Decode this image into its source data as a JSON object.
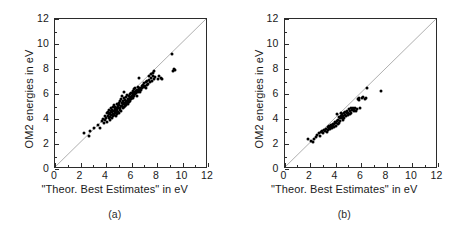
{
  "figure": {
    "panels": [
      {
        "id": "panel-a",
        "caption": "(a)",
        "xlabel": "\"Theor. Best Estimates\" in eV",
        "ylabel": "OM2 energies in eV"
      },
      {
        "id": "panel-b",
        "caption": "(b)",
        "xlabel": "\"Theor. Best Estimates\" in eV",
        "ylabel": "OM2 energies in eV"
      }
    ]
  },
  "chart_data": [
    {
      "type": "scatter",
      "panel": "(a)",
      "title": "",
      "xlabel": "\"Theor. Best Estimates\" in eV",
      "ylabel": "OM2 energies in eV",
      "xlim": [
        0,
        12
      ],
      "ylim": [
        0,
        12
      ],
      "xticks": [
        0,
        2,
        4,
        6,
        8,
        10,
        12
      ],
      "yticks": [
        0,
        2,
        4,
        6,
        8,
        10,
        12
      ],
      "grid": false,
      "legend": null,
      "reference_line": {
        "type": "identity",
        "equation": "y = x",
        "color": "#9a9a9a"
      },
      "marker": {
        "shape": "circle",
        "filled": true,
        "color": "#000000",
        "size_px": 3
      },
      "n_points": 140,
      "points": [
        [
          2.25,
          2.85
        ],
        [
          2.7,
          2.62
        ],
        [
          2.78,
          3.08
        ],
        [
          3.05,
          3.3
        ],
        [
          3.35,
          3.52
        ],
        [
          3.5,
          3.3
        ],
        [
          3.72,
          3.88
        ],
        [
          3.8,
          4.02
        ],
        [
          3.85,
          3.65
        ],
        [
          3.9,
          4.28
        ],
        [
          3.95,
          3.95
        ],
        [
          4.0,
          4.1
        ],
        [
          4.05,
          4.45
        ],
        [
          4.08,
          3.8
        ],
        [
          4.12,
          4.22
        ],
        [
          4.15,
          4.6
        ],
        [
          4.2,
          4.05
        ],
        [
          4.22,
          4.38
        ],
        [
          4.25,
          4.72
        ],
        [
          4.3,
          4.18
        ],
        [
          4.32,
          4.5
        ],
        [
          4.35,
          3.92
        ],
        [
          4.38,
          4.62
        ],
        [
          4.4,
          4.3
        ],
        [
          4.42,
          4.85
        ],
        [
          4.45,
          4.08
        ],
        [
          4.48,
          4.55
        ],
        [
          4.5,
          4.72
        ],
        [
          4.52,
          4.25
        ],
        [
          4.55,
          4.95
        ],
        [
          4.58,
          4.4
        ],
        [
          4.6,
          4.68
        ],
        [
          4.62,
          5.1
        ],
        [
          4.65,
          4.32
        ],
        [
          4.68,
          4.82
        ],
        [
          4.7,
          4.52
        ],
        [
          4.72,
          5.0
        ],
        [
          4.75,
          4.62
        ],
        [
          4.78,
          4.28
        ],
        [
          4.8,
          4.9
        ],
        [
          4.82,
          4.45
        ],
        [
          4.85,
          5.22
        ],
        [
          4.88,
          4.7
        ],
        [
          4.9,
          4.38
        ],
        [
          4.92,
          5.05
        ],
        [
          4.95,
          4.58
        ],
        [
          4.98,
          4.85
        ],
        [
          5.0,
          5.3
        ],
        [
          5.02,
          4.48
        ],
        [
          5.05,
          5.12
        ],
        [
          5.08,
          4.75
        ],
        [
          5.1,
          5.42
        ],
        [
          5.12,
          4.92
        ],
        [
          5.15,
          5.6
        ],
        [
          5.18,
          5.02
        ],
        [
          5.2,
          4.68
        ],
        [
          5.22,
          5.28
        ],
        [
          5.25,
          5.85
        ],
        [
          5.28,
          5.08
        ],
        [
          5.3,
          4.88
        ],
        [
          5.32,
          5.45
        ],
        [
          5.35,
          5.18
        ],
        [
          5.38,
          5.7
        ],
        [
          5.4,
          4.98
        ],
        [
          5.42,
          5.32
        ],
        [
          5.45,
          6.15
        ],
        [
          5.48,
          5.22
        ],
        [
          5.5,
          5.52
        ],
        [
          5.52,
          5.05
        ],
        [
          5.55,
          5.38
        ],
        [
          5.58,
          5.75
        ],
        [
          5.6,
          5.15
        ],
        [
          5.62,
          5.48
        ],
        [
          5.65,
          5.92
        ],
        [
          5.68,
          5.28
        ],
        [
          5.7,
          5.62
        ],
        [
          5.72,
          5.4
        ],
        [
          5.75,
          5.18
        ],
        [
          5.78,
          5.55
        ],
        [
          5.8,
          5.85
        ],
        [
          5.82,
          5.35
        ],
        [
          5.85,
          5.68
        ],
        [
          5.88,
          6.02
        ],
        [
          5.9,
          5.45
        ],
        [
          5.92,
          5.78
        ],
        [
          5.95,
          5.58
        ],
        [
          5.98,
          6.12
        ],
        [
          6.0,
          5.88
        ],
        [
          6.05,
          5.65
        ],
        [
          6.08,
          6.25
        ],
        [
          6.1,
          5.95
        ],
        [
          6.12,
          5.72
        ],
        [
          6.15,
          6.08
        ],
        [
          6.18,
          6.38
        ],
        [
          6.2,
          5.82
        ],
        [
          6.25,
          6.18
        ],
        [
          6.28,
          5.98
        ],
        [
          6.3,
          6.45
        ],
        [
          6.35,
          6.08
        ],
        [
          6.38,
          6.28
        ],
        [
          6.4,
          5.88
        ],
        [
          6.45,
          6.35
        ],
        [
          6.5,
          6.15
        ],
        [
          6.52,
          6.55
        ],
        [
          6.55,
          6.25
        ],
        [
          6.6,
          6.42
        ],
        [
          6.65,
          6.18
        ],
        [
          6.7,
          6.52
        ],
        [
          6.75,
          6.32
        ],
        [
          6.8,
          6.62
        ],
        [
          6.85,
          6.45
        ],
        [
          6.9,
          6.72
        ],
        [
          6.95,
          6.55
        ],
        [
          7.0,
          6.85
        ],
        [
          7.05,
          6.62
        ],
        [
          7.1,
          6.48
        ],
        [
          7.15,
          6.95
        ],
        [
          7.2,
          6.72
        ],
        [
          7.25,
          7.05
        ],
        [
          7.3,
          6.82
        ],
        [
          7.35,
          7.42
        ],
        [
          7.4,
          7.15
        ],
        [
          7.45,
          6.95
        ],
        [
          7.5,
          7.58
        ],
        [
          7.55,
          7.28
        ],
        [
          7.6,
          7.05
        ],
        [
          7.65,
          7.72
        ],
        [
          7.7,
          7.48
        ],
        [
          7.75,
          7.18
        ],
        [
          7.8,
          7.88
        ],
        [
          7.85,
          7.35
        ],
        [
          8.05,
          7.22
        ],
        [
          8.15,
          7.45
        ],
        [
          8.3,
          7.25
        ],
        [
          8.4,
          7.18
        ],
        [
          9.15,
          9.2
        ],
        [
          9.25,
          7.82
        ],
        [
          9.35,
          8.02
        ],
        [
          9.4,
          7.95
        ],
        [
          6.55,
          7.25
        ]
      ]
    },
    {
      "type": "scatter",
      "panel": "(b)",
      "title": "",
      "xlabel": "\"Theor. Best Estimates\" in eV",
      "ylabel": "OM2 energies in eV",
      "xlim": [
        0,
        12
      ],
      "ylim": [
        0,
        12
      ],
      "xticks": [
        0,
        2,
        4,
        6,
        8,
        10,
        12
      ],
      "yticks": [
        0,
        2,
        4,
        6,
        8,
        10,
        12
      ],
      "grid": false,
      "legend": null,
      "reference_line": {
        "type": "identity",
        "equation": "y = x",
        "color": "#9a9a9a"
      },
      "marker": {
        "shape": "circle",
        "filled": true,
        "color": "#000000",
        "size_px": 3
      },
      "n_points": 75,
      "points": [
        [
          1.85,
          2.38
        ],
        [
          2.05,
          2.28
        ],
        [
          2.2,
          2.18
        ],
        [
          2.3,
          2.42
        ],
        [
          2.45,
          2.55
        ],
        [
          2.55,
          2.72
        ],
        [
          2.68,
          2.85
        ],
        [
          2.75,
          2.62
        ],
        [
          2.85,
          2.95
        ],
        [
          2.95,
          3.02
        ],
        [
          3.05,
          2.88
        ],
        [
          3.1,
          3.15
        ],
        [
          3.18,
          3.05
        ],
        [
          3.25,
          3.22
        ],
        [
          3.3,
          2.98
        ],
        [
          3.38,
          3.35
        ],
        [
          3.42,
          3.12
        ],
        [
          3.48,
          3.28
        ],
        [
          3.52,
          3.45
        ],
        [
          3.58,
          3.18
        ],
        [
          3.62,
          3.4
        ],
        [
          3.68,
          3.55
        ],
        [
          3.72,
          3.28
        ],
        [
          3.78,
          3.48
        ],
        [
          3.82,
          3.62
        ],
        [
          3.88,
          3.38
        ],
        [
          3.92,
          3.58
        ],
        [
          3.95,
          3.75
        ],
        [
          4.0,
          3.45
        ],
        [
          4.05,
          3.68
        ],
        [
          4.08,
          4.42
        ],
        [
          4.12,
          3.85
        ],
        [
          4.18,
          3.58
        ],
        [
          4.22,
          3.95
        ],
        [
          4.25,
          4.15
        ],
        [
          4.28,
          3.72
        ],
        [
          4.32,
          4.05
        ],
        [
          4.38,
          3.88
        ],
        [
          4.42,
          4.28
        ],
        [
          4.45,
          4.52
        ],
        [
          4.48,
          4.08
        ],
        [
          4.52,
          4.38
        ],
        [
          4.55,
          3.92
        ],
        [
          4.6,
          4.22
        ],
        [
          4.65,
          4.48
        ],
        [
          4.68,
          4.12
        ],
        [
          4.72,
          4.35
        ],
        [
          4.78,
          4.58
        ],
        [
          4.82,
          4.25
        ],
        [
          4.88,
          4.45
        ],
        [
          4.92,
          4.68
        ],
        [
          4.95,
          4.32
        ],
        [
          5.0,
          4.52
        ],
        [
          5.05,
          4.78
        ],
        [
          5.1,
          4.42
        ],
        [
          5.15,
          4.62
        ],
        [
          5.2,
          4.85
        ],
        [
          5.25,
          4.52
        ],
        [
          5.3,
          4.72
        ],
        [
          5.38,
          4.88
        ],
        [
          5.42,
          4.62
        ],
        [
          5.48,
          4.78
        ],
        [
          5.55,
          4.92
        ],
        [
          5.6,
          4.68
        ],
        [
          5.68,
          4.82
        ],
        [
          5.75,
          5.62
        ],
        [
          5.82,
          5.55
        ],
        [
          5.88,
          5.72
        ],
        [
          5.95,
          4.88
        ],
        [
          6.05,
          5.65
        ],
        [
          6.18,
          5.78
        ],
        [
          6.3,
          5.58
        ],
        [
          6.42,
          5.72
        ],
        [
          6.48,
          6.52
        ],
        [
          7.55,
          6.28
        ]
      ]
    }
  ]
}
